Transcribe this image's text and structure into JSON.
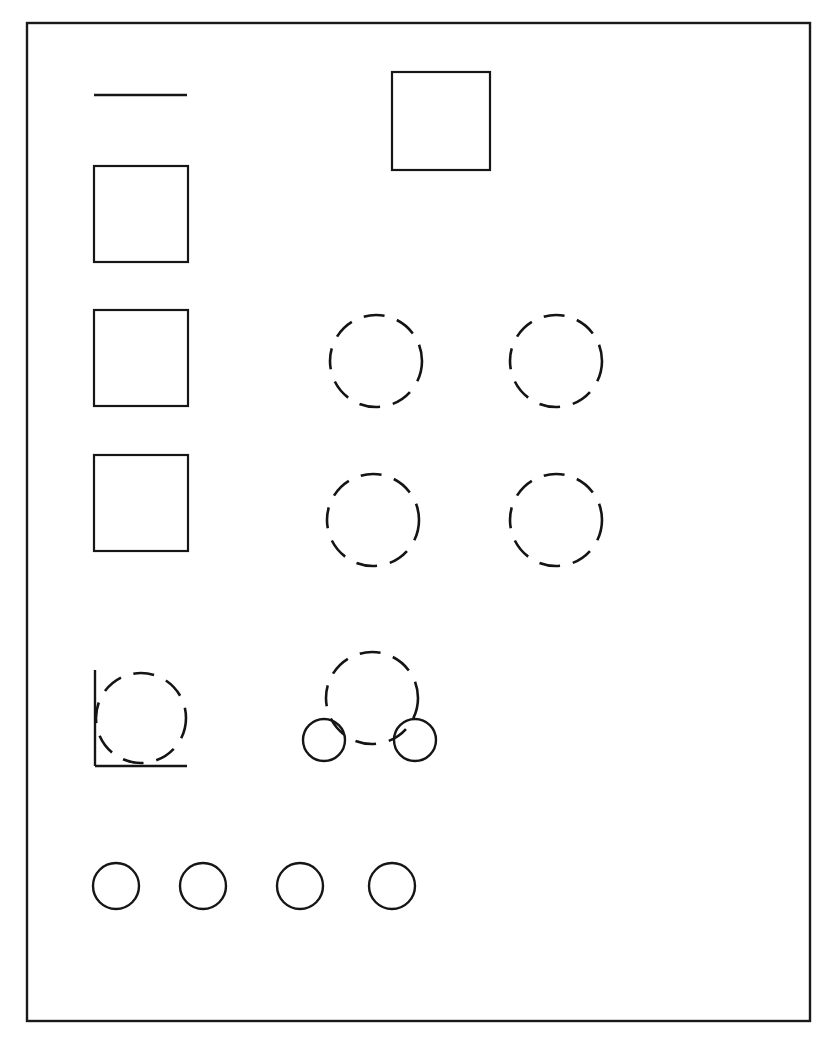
{
  "figure": {
    "background_color": "#ffffff",
    "ink_color": "#161616",
    "canvas": {
      "width": 837,
      "height": 1047
    }
  },
  "frame": {
    "name": "outer-border",
    "x": 27,
    "y": 23,
    "width": 783,
    "height": 998,
    "stroke_width": 2.4,
    "color": "#1a1a1a"
  },
  "shapes": {
    "rule": {
      "label": "horizontal-rule",
      "x1": 94,
      "y1": 95,
      "x2": 187,
      "y2": 95,
      "stroke_width": 2.6
    },
    "squares": [
      {
        "label": "square-top-right",
        "x": 392,
        "y": 72,
        "width": 98,
        "height": 98
      },
      {
        "label": "square-left-1",
        "x": 94,
        "y": 166,
        "width": 94,
        "height": 96
      },
      {
        "label": "square-left-2",
        "x": 94,
        "y": 310,
        "width": 94,
        "height": 96
      },
      {
        "label": "square-left-3",
        "x": 94,
        "y": 455,
        "width": 94,
        "height": 96
      }
    ],
    "dashed_circles": [
      {
        "label": "dashed-circle-r1-c1",
        "cx": 376,
        "cy": 361,
        "r": 46
      },
      {
        "label": "dashed-circle-r1-c2",
        "cx": 556,
        "cy": 361,
        "r": 46
      },
      {
        "label": "dashed-circle-r2-c1",
        "cx": 373,
        "cy": 520,
        "r": 46
      },
      {
        "label": "dashed-circle-r2-c2",
        "cx": 556,
        "cy": 520,
        "r": 46
      },
      {
        "label": "dashed-circle-corner",
        "cx": 141,
        "cy": 718,
        "r": 45
      },
      {
        "label": "dashed-circle-center-large",
        "cx": 372,
        "cy": 698,
        "r": 46
      }
    ],
    "corner_mark": {
      "label": "l-corner-mark",
      "vertical": {
        "x1": 95,
        "y1": 670,
        "x2": 95,
        "y2": 766
      },
      "horizontal": {
        "x1": 95,
        "y1": 766,
        "x2": 187,
        "y2": 766
      },
      "stroke_width": 2.4
    },
    "solid_circles_pair": [
      {
        "label": "small-circle-left",
        "cx": 324,
        "cy": 740,
        "r": 21
      },
      {
        "label": "small-circle-right",
        "cx": 415,
        "cy": 740,
        "r": 21
      }
    ],
    "solid_circles_row": [
      {
        "label": "bottom-circle-1",
        "cx": 116,
        "cy": 886,
        "r": 23
      },
      {
        "label": "bottom-circle-2",
        "cx": 203,
        "cy": 886,
        "r": 23
      },
      {
        "label": "bottom-circle-3",
        "cx": 300,
        "cy": 886,
        "r": 23
      },
      {
        "label": "bottom-circle-4",
        "cx": 392,
        "cy": 886,
        "r": 23
      }
    ]
  }
}
